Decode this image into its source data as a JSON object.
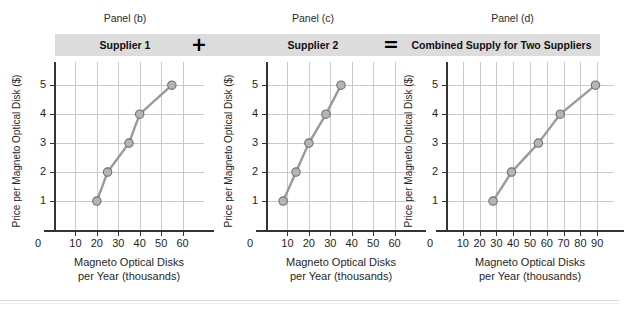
{
  "figure": {
    "background_color": "#ffffff",
    "band_color": "#dcdcdc",
    "line_color": "#9a9a9a",
    "marker_fill": "#b5b5b5",
    "marker_stroke": "#6e6e6e",
    "grid_color": "#c9c9c9",
    "axis_color": "#333333"
  },
  "captions": {
    "panel_b": "Panel (b)",
    "panel_c": "Panel (c)",
    "panel_d": "Panel (d)"
  },
  "band": {
    "supplier_1": "Supplier 1",
    "supplier_2": "Supplier 2",
    "combined": "Combined Supply for Two Suppliers",
    "operator_plus": "+",
    "operator_equals": "=",
    "plus_icon_name": "plus-operator-icon",
    "equals_icon_name": "equals-operator-icon"
  },
  "axis_titles": {
    "y": "Price per Magneto Optical Disk ($)",
    "x_line1": "Magneto Optical Disks",
    "x_line2": "per Year (thousands)"
  },
  "chart_data": [
    {
      "type": "line",
      "id": "panel-b",
      "title": "Supplier 1",
      "panel_label": "Panel (b)",
      "xlabel": "Magneto Optical Disks per Year (thousands)",
      "ylabel": "Price per Magneto Optical Disk ($)",
      "xlim": [
        0,
        70
      ],
      "ylim": [
        0,
        5.8
      ],
      "xticks": [
        0,
        10,
        20,
        30,
        40,
        50,
        60
      ],
      "yticks": [
        1,
        2,
        3,
        4,
        5
      ],
      "grid": true,
      "legend": "none",
      "x": [
        20,
        25,
        35,
        40,
        55
      ],
      "y": [
        1,
        2,
        3,
        4,
        5
      ],
      "marker": "circle"
    },
    {
      "type": "line",
      "id": "panel-c",
      "title": "Supplier 2",
      "panel_label": "Panel (c)",
      "xlabel": "Magneto Optical Disks per Year (thousands)",
      "ylabel": "Price per Magneto Optical Disk ($)",
      "xlim": [
        0,
        70
      ],
      "ylim": [
        0,
        5.8
      ],
      "xticks": [
        0,
        10,
        20,
        30,
        40,
        50,
        60
      ],
      "yticks": [
        1,
        2,
        3,
        4,
        5
      ],
      "grid": true,
      "legend": "none",
      "x": [
        8,
        14,
        20,
        28,
        35
      ],
      "y": [
        1,
        2,
        3,
        4,
        5
      ],
      "marker": "circle"
    },
    {
      "type": "line",
      "id": "panel-d",
      "title": "Combined Supply for Two Suppliers",
      "panel_label": "Panel (d)",
      "xlabel": "Magneto Optical Disks per Year (thousands)",
      "ylabel": "Price per Magneto Optical Disk ($)",
      "xlim": [
        0,
        100
      ],
      "ylim": [
        0,
        5.8
      ],
      "xticks": [
        0,
        10,
        20,
        30,
        40,
        50,
        60,
        70,
        80,
        90
      ],
      "yticks": [
        1,
        2,
        3,
        4,
        5
      ],
      "grid": true,
      "legend": "none",
      "x": [
        28,
        39,
        55,
        68,
        89
      ],
      "y": [
        1,
        2,
        3,
        4,
        5
      ],
      "marker": "circle"
    }
  ]
}
